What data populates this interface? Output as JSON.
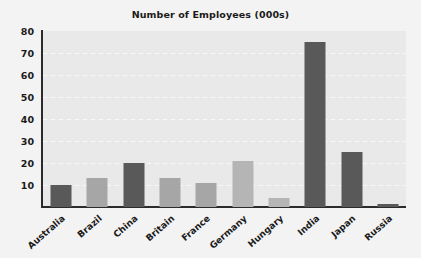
{
  "chart_data": {
    "type": "bar",
    "title": "Number of Employees (000s)",
    "xlabel": "",
    "ylabel": "",
    "categories": [
      "Australia",
      "Brazil",
      "China",
      "Britain",
      "France",
      "Germany",
      "Hungary",
      "India",
      "Japan",
      "Russia"
    ],
    "values": [
      10,
      13,
      20,
      13,
      11,
      21,
      4,
      75,
      25,
      1.5
    ],
    "ylim": [
      0,
      80
    ],
    "yticks": [
      10,
      20,
      30,
      40,
      50,
      60,
      70,
      80
    ],
    "ytick_labels": [
      "10",
      "20",
      "30",
      "40",
      "50",
      "60",
      "70",
      "80"
    ],
    "grid": true,
    "legend": "none",
    "bar_colors": [
      "#595959",
      "#a6a6a6",
      "#595959",
      "#a6a6a6",
      "#a6a6a6",
      "#b5b5b5",
      "#b5b5b5",
      "#595959",
      "#595959",
      "#595959"
    ],
    "series": [
      {
        "name": "Number of Employees (000s)",
        "values": [
          10,
          13,
          20,
          13,
          11,
          21,
          4,
          75,
          25,
          1.5
        ]
      }
    ]
  },
  "style": {
    "plot_background": "#e9e9e9",
    "figure_background": "#f3f3f3",
    "axis_color": "#2b2b2b",
    "gridline_color": "#fafafa",
    "text_color": "#1a1a1a",
    "bar_dark": "#595959",
    "bar_light": "#a6a6a6"
  }
}
